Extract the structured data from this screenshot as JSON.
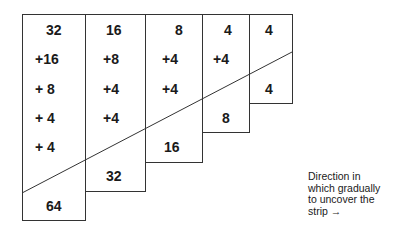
{
  "diagram": {
    "columns": [
      {
        "id": "col-1",
        "top_value": "32",
        "additions": [
          "+16",
          "+ 8",
          "+ 4",
          "+ 4"
        ],
        "bottom_value": "64"
      },
      {
        "id": "col-2",
        "top_value": "16",
        "additions": [
          "+8",
          "+4",
          "+4"
        ],
        "bottom_value": "32"
      },
      {
        "id": "col-3",
        "top_value": "8",
        "additions": [
          "+4",
          "+4"
        ],
        "bottom_value": "16"
      },
      {
        "id": "col-4",
        "top_value": "4",
        "additions": [
          "+4"
        ],
        "bottom_value": "8"
      },
      {
        "id": "col-5",
        "top_value": "4",
        "additions": [],
        "bottom_value": "4"
      }
    ],
    "caption": {
      "line1": "Direction in",
      "line2": "which gradually",
      "line3": "to uncover the",
      "line4": "strip →"
    },
    "colors": {
      "line": "#333333",
      "text": "#1a1a1a",
      "background": "#ffffff"
    }
  }
}
